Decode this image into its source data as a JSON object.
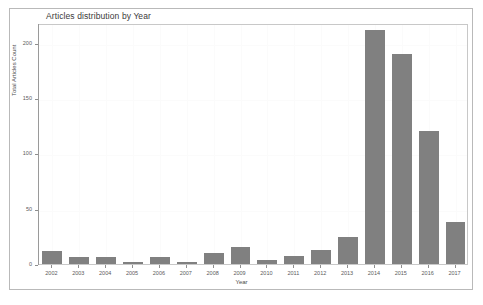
{
  "chart_data": {
    "type": "bar",
    "title": "Articles distribution by Year",
    "xlabel": "Year",
    "ylabel": "Total Articles Count",
    "categories": [
      "2002",
      "2003",
      "2004",
      "2005",
      "2006",
      "2007",
      "2008",
      "2009",
      "2010",
      "2011",
      "2012",
      "2013",
      "2014",
      "2015",
      "2016",
      "2017"
    ],
    "values": [
      12,
      6,
      6,
      2,
      6,
      2,
      10,
      15,
      4,
      7,
      13,
      24,
      212,
      190,
      120,
      38
    ],
    "ylim": [
      0,
      218
    ],
    "yticks": [
      0,
      50,
      100,
      150,
      200
    ],
    "ytick_labels": [
      "0",
      "50",
      "100",
      "150",
      "200"
    ],
    "grid": true,
    "legend": "none",
    "bar_color": "#808080",
    "background_color": "#ffffff",
    "axis_color": "#9a9a9a"
  }
}
